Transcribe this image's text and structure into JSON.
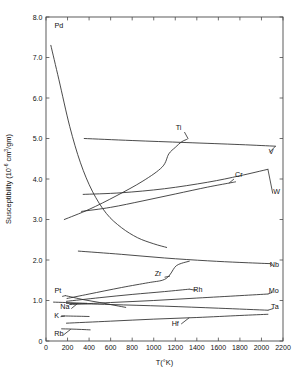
{
  "chart_data": {
    "type": "line",
    "title": "",
    "xlabel": "T(°K)",
    "ylabel": "Susceptibility (10⁻⁶ cm³/gm)",
    "ylabel_main": "Susceptibility  (10",
    "ylabel_exp": "-6",
    "ylabel_tail": " cm",
    "ylabel_exp2": "3",
    "ylabel_tail2": "/gm)",
    "xlim": [
      0,
      2200
    ],
    "ylim": [
      0,
      8.0
    ],
    "grid": false,
    "legend_position": "inline-end-labels",
    "xticks": [
      0,
      200,
      400,
      600,
      800,
      1000,
      1200,
      1400,
      1600,
      1800,
      2000,
      2200
    ],
    "xticklabels": [
      "0",
      "200",
      "400",
      "600",
      "800",
      "1000",
      "1200",
      "1400",
      "1600",
      "1800",
      "2000",
      "2200"
    ],
    "yticks": [
      0,
      1.0,
      2.0,
      3.0,
      4.0,
      5.0,
      6.0,
      7.0,
      8.0
    ],
    "yticklabels": [
      "0",
      "1.0",
      "2.0",
      "3.0",
      "4.0",
      "5.0",
      "6.0",
      "7.0",
      "8.0"
    ],
    "series": [
      {
        "name": "Pd",
        "label": "Pd",
        "label_x": 120,
        "label_y": 7.72,
        "points": [
          [
            45,
            7.3
          ],
          [
            120,
            6.45
          ],
          [
            220,
            5.3
          ],
          [
            320,
            4.4
          ],
          [
            430,
            3.7
          ],
          [
            560,
            3.15
          ],
          [
            700,
            2.8
          ],
          [
            850,
            2.55
          ],
          [
            1000,
            2.4
          ],
          [
            1120,
            2.31
          ]
        ]
      },
      {
        "name": "V",
        "label": "V",
        "label_x": 2090,
        "label_y": 4.62,
        "points": [
          [
            355,
            5.0
          ],
          [
            800,
            4.95
          ],
          [
            1300,
            4.9
          ],
          [
            1800,
            4.85
          ],
          [
            2130,
            4.81
          ]
        ]
      },
      {
        "name": "Ti",
        "label": "Ti",
        "label_x": 1230,
        "label_y": 5.21,
        "points": [
          [
            170,
            3.0
          ],
          [
            400,
            3.25
          ],
          [
            650,
            3.58
          ],
          [
            900,
            3.95
          ],
          [
            1080,
            4.3
          ],
          [
            1140,
            4.62
          ],
          [
            1200,
            4.78
          ],
          [
            1260,
            4.92
          ],
          [
            1310,
            4.98
          ]
        ]
      },
      {
        "name": "Cr",
        "label": "Cr",
        "label_x": 1790,
        "label_y": 4.04,
        "points": [
          [
            330,
            3.2
          ],
          [
            600,
            3.3
          ],
          [
            900,
            3.46
          ],
          [
            1200,
            3.63
          ],
          [
            1500,
            3.8
          ],
          [
            1700,
            3.9
          ],
          [
            1760,
            3.93
          ]
        ]
      },
      {
        "name": "W",
        "label": "W",
        "label_x": 2140,
        "label_y": 3.62,
        "points": [
          [
            345,
            3.62
          ],
          [
            700,
            3.66
          ],
          [
            1100,
            3.76
          ],
          [
            1500,
            3.92
          ],
          [
            1800,
            4.08
          ],
          [
            2060,
            4.24
          ]
        ]
      },
      {
        "name": "Nb",
        "label": "Nb",
        "label_x": 2120,
        "label_y": 1.82,
        "points": [
          [
            300,
            2.22
          ],
          [
            700,
            2.14
          ],
          [
            1100,
            2.05
          ],
          [
            1500,
            1.98
          ],
          [
            1800,
            1.94
          ],
          [
            2080,
            1.91
          ]
        ]
      },
      {
        "name": "Zr",
        "label": "Zr",
        "label_x": 1040,
        "label_y": 1.6,
        "points": [
          [
            195,
            1.05
          ],
          [
            400,
            1.16
          ],
          [
            700,
            1.32
          ],
          [
            950,
            1.44
          ],
          [
            1080,
            1.5
          ],
          [
            1140,
            1.6
          ],
          [
            1180,
            1.76
          ],
          [
            1210,
            1.86
          ],
          [
            1260,
            1.92
          ],
          [
            1330,
            1.97
          ]
        ]
      },
      {
        "name": "Rh",
        "label": "Rh",
        "label_x": 1410,
        "label_y": 1.22,
        "points": [
          [
            190,
            0.98
          ],
          [
            500,
            1.07
          ],
          [
            800,
            1.15
          ],
          [
            1100,
            1.22
          ],
          [
            1330,
            1.28
          ]
        ]
      },
      {
        "name": "Mo",
        "label": "Mo",
        "label_x": 2115,
        "label_y": 1.18,
        "points": [
          [
            220,
            0.9
          ],
          [
            600,
            0.95
          ],
          [
            1000,
            1.0
          ],
          [
            1400,
            1.06
          ],
          [
            1800,
            1.12
          ],
          [
            2060,
            1.16
          ]
        ]
      },
      {
        "name": "Ta",
        "label": "Ta",
        "label_x": 2125,
        "label_y": 0.78,
        "points": [
          [
            190,
            0.93
          ],
          [
            600,
            0.9
          ],
          [
            1100,
            0.86
          ],
          [
            1600,
            0.81
          ],
          [
            2060,
            0.76
          ]
        ]
      },
      {
        "name": "Hf",
        "label": "Hf",
        "label_x": 1200,
        "label_y": 0.38,
        "points": [
          [
            190,
            0.44
          ],
          [
            600,
            0.49
          ],
          [
            1000,
            0.54
          ],
          [
            1400,
            0.58
          ],
          [
            1800,
            0.63
          ],
          [
            2060,
            0.66
          ]
        ]
      },
      {
        "name": "Pt",
        "label": "Pt",
        "label_x": 110,
        "label_y": 1.18,
        "points": [
          [
            180,
            1.12
          ],
          [
            350,
            1.02
          ],
          [
            500,
            0.95
          ],
          [
            640,
            0.88
          ],
          [
            740,
            0.83
          ]
        ]
      },
      {
        "name": "Na",
        "label": "Na",
        "label_x": 175,
        "label_y": 0.78,
        "points": [
          [
            70,
            0.96
          ],
          [
            180,
            0.95
          ],
          [
            280,
            0.94
          ],
          [
            380,
            0.93
          ]
        ]
      },
      {
        "name": "K",
        "label": "K",
        "label_x": 100,
        "label_y": 0.58,
        "points": [
          [
            145,
            0.62
          ],
          [
            230,
            0.615
          ],
          [
            330,
            0.61
          ],
          [
            400,
            0.605
          ]
        ]
      },
      {
        "name": "Rb",
        "label": "Rb",
        "label_x": 120,
        "label_y": 0.115,
        "points": [
          [
            145,
            0.3
          ],
          [
            230,
            0.295
          ],
          [
            330,
            0.285
          ],
          [
            410,
            0.275
          ]
        ]
      }
    ],
    "leaders": [
      {
        "name": "leader-Pt",
        "from": [
          150,
          1.1
        ],
        "to": [
          180,
          1.12
        ]
      },
      {
        "name": "leader-Na",
        "from": [
          235,
          0.8
        ],
        "to": [
          290,
          0.92
        ]
      },
      {
        "name": "leader-K",
        "from": [
          135,
          0.6
        ],
        "to": [
          175,
          0.615
        ]
      },
      {
        "name": "leader-Rb",
        "from": [
          160,
          0.145
        ],
        "to": [
          230,
          0.29
        ]
      },
      {
        "name": "leader-Zr",
        "from": [
          1100,
          1.575
        ],
        "to": [
          1150,
          1.6
        ]
      },
      {
        "name": "leader-Ti",
        "from": [
          1285,
          5.16
        ],
        "to": [
          1320,
          4.99
        ]
      },
      {
        "name": "leader-Cr",
        "from": [
          1745,
          4.0
        ],
        "to": [
          1700,
          3.9
        ]
      },
      {
        "name": "leader-W",
        "from": [
          2105,
          3.64
        ],
        "to": [
          2060,
          4.24
        ]
      },
      {
        "name": "leader-V",
        "from": [
          2075,
          4.66
        ],
        "to": [
          2130,
          4.81
        ]
      },
      {
        "name": "leader-Nb",
        "from": [
          2100,
          1.85
        ],
        "to": [
          2080,
          1.91
        ]
      },
      {
        "name": "leader-Mo",
        "from": [
          2100,
          1.2
        ],
        "to": [
          2060,
          1.16
        ]
      },
      {
        "name": "leader-Ta",
        "from": [
          2108,
          0.8
        ],
        "to": [
          2060,
          0.76
        ]
      },
      {
        "name": "leader-Rh",
        "from": [
          1395,
          1.25
        ],
        "to": [
          1330,
          1.28
        ]
      },
      {
        "name": "leader-Hf",
        "from": [
          1255,
          0.42
        ],
        "to": [
          1330,
          0.575
        ]
      }
    ]
  }
}
